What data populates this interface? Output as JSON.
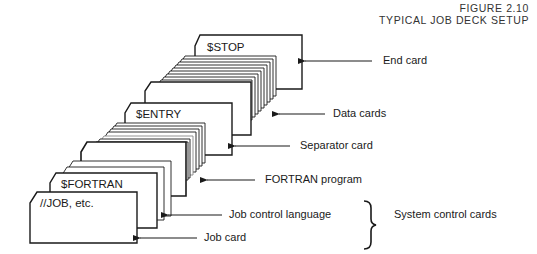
{
  "figure": {
    "number": "FIGURE 2.10",
    "title": "TYPICAL JOB DECK SETUP"
  },
  "cards": {
    "stop": "$STOP",
    "entry": "$ENTRY",
    "fortran": "$FORTRAN",
    "job": "//JOB, etc."
  },
  "callouts": {
    "end_card": "End card",
    "data_cards": "Data cards",
    "separator_card": "Separator card",
    "fortran_program": "FORTRAN program",
    "job_control_language": "Job control language",
    "job_card": "Job card",
    "system_control_cards": "System control cards"
  },
  "brace_symbol": "}"
}
